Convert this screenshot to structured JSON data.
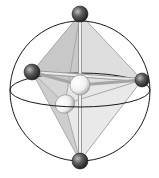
{
  "diagram": {
    "title": "Octahedral geometry inscribed in a sphere",
    "colors": {
      "background": "#ffffff",
      "sphere_outline": "#1a1a1a",
      "face_fill": "#d6d6d6",
      "bond": "#bdbdbd",
      "ligand_atom": "#4a4a4a",
      "central_atom": "#f4f4f4"
    },
    "sphere": {
      "cx": 80,
      "cy": 91,
      "r": 70
    },
    "equator": {
      "cx": 80,
      "cy": 90,
      "rx": 70,
      "ry": 17
    },
    "atoms": [
      {
        "id": "top",
        "type": "ligand",
        "cx": 80,
        "cy": 14,
        "r": 8
      },
      {
        "id": "left",
        "type": "ligand",
        "cx": 32,
        "cy": 72,
        "r": 8
      },
      {
        "id": "right",
        "type": "ligand",
        "cx": 142,
        "cy": 80,
        "r": 7
      },
      {
        "id": "bottom",
        "type": "ligand",
        "cx": 80,
        "cy": 161,
        "r": 8
      },
      {
        "id": "back",
        "type": "vertex",
        "cx": 80,
        "cy": 85,
        "r": 10
      },
      {
        "id": "front",
        "type": "vertex",
        "cx": 65,
        "cy": 104,
        "r": 9
      }
    ]
  }
}
